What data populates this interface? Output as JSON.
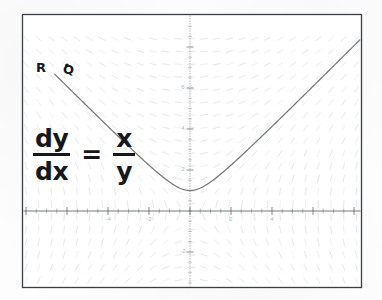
{
  "figure": {
    "kind": "slope-field-plot",
    "equation": {
      "lhs_numerator": "dy",
      "lhs_denominator": "dx",
      "equals": "=",
      "rhs_numerator": "x",
      "rhs_denominator": "y",
      "plain": "dy/dx = x/y"
    },
    "annotations": [
      {
        "name": "point-label-R",
        "text": "R",
        "x": -6.6,
        "y": 7.0
      },
      {
        "name": "point-label-Q",
        "text": "Q",
        "x": -5.3,
        "y": 6.9
      }
    ],
    "marked_point": {
      "name": "solution-point-marker",
      "x": -6.0,
      "y": 7.1
    },
    "colors": {
      "frame": "#3b3e42",
      "axis": "#5f6368",
      "slope_field": "#c3c6ca",
      "solution_curve": "#6d7075",
      "tick_label": "#b4b7bb",
      "equation_text": "#15181c",
      "background": "#fdfdfd"
    }
  },
  "chart_data": {
    "type": "line",
    "title": "",
    "subtitle": "",
    "xlabel": "",
    "ylabel": "",
    "xlim": [
      -8.2,
      9.4
    ],
    "ylim": [
      -4.3,
      9.4
    ],
    "grid": false,
    "legend": "none",
    "axis": {
      "x_ticks": [
        -4,
        -2,
        2,
        4
      ],
      "x_tick_labels": [
        "-4",
        "-2",
        "2",
        "4"
      ],
      "y_ticks": [
        2,
        4,
        6,
        -2
      ],
      "y_tick_labels": [
        "2",
        "4",
        "6",
        "-2"
      ],
      "minor_tick_step": 0.5
    },
    "slope_field": {
      "description": "Direction field of dy/dx = x/y drawn as short tick segments on a regular lattice",
      "formula": "x/y",
      "x_range": [
        -8,
        9
      ],
      "y_range": [
        -4,
        9
      ],
      "x_step": 0.62,
      "y_step": 0.62,
      "segment_length_px": 7
    },
    "series": [
      {
        "name": "solution-curve",
        "formula": "y = sqrt(x^2 + 1)",
        "description": "Particular solution through the marked point; hyperbola branch with minimum at (0, 1)",
        "x": [
          -6.6,
          -6.0,
          -5.0,
          -4.0,
          -3.0,
          -2.0,
          -1.0,
          -0.5,
          0,
          0.5,
          1.0,
          2.0,
          3.0,
          4.0,
          5.0,
          6.0,
          7.0,
          8.0,
          8.4
        ],
        "y": [
          6.68,
          6.08,
          5.1,
          4.12,
          3.16,
          2.24,
          1.41,
          1.12,
          1.0,
          1.12,
          1.41,
          2.24,
          3.16,
          4.12,
          5.1,
          6.08,
          7.07,
          8.06,
          8.46
        ]
      }
    ]
  }
}
